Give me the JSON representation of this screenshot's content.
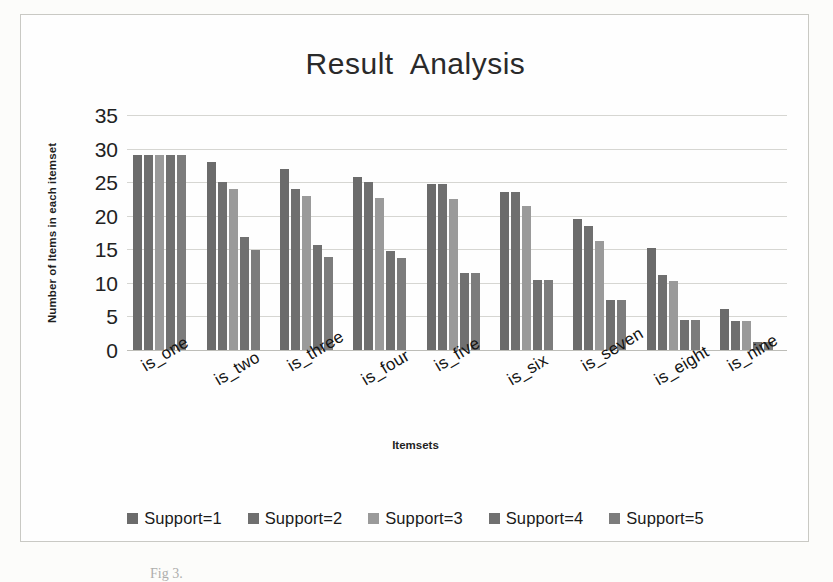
{
  "figure": {
    "caption": "Fig 3."
  },
  "chart_data": {
    "type": "bar",
    "title": "Result  Analysis",
    "xlabel": "Itemsets",
    "ylabel": "Number of Items in each itemset",
    "categories": [
      "is_one",
      "is_two",
      "is_three",
      "is_four",
      "is_five",
      "is_six",
      "is_seven",
      "is_eight",
      "is_nine"
    ],
    "yticks": [
      0,
      5,
      10,
      15,
      20,
      25,
      30,
      35
    ],
    "ylim": [
      0,
      35
    ],
    "grid": true,
    "legend_position": "bottom",
    "series": [
      {
        "name": "Support=1",
        "color": "#6b6b6b",
        "values": [
          29,
          28,
          27,
          25.8,
          24.7,
          23.5,
          19.5,
          15.2,
          6.1
        ]
      },
      {
        "name": "Support=2",
        "color": "#6f6f6f",
        "values": [
          29,
          25,
          24,
          25,
          24.7,
          23.5,
          18.4,
          11.2,
          4.3
        ]
      },
      {
        "name": "Support=3",
        "color": "#9a9a9a",
        "values": [
          29,
          24,
          23,
          22.7,
          22.5,
          21.4,
          16.2,
          10.3,
          4.3
        ]
      },
      {
        "name": "Support=4",
        "color": "#707070",
        "values": [
          29,
          16.8,
          15.7,
          14.7,
          11.5,
          10.5,
          7.4,
          4.4,
          1.2
        ]
      },
      {
        "name": "Support=5",
        "color": "#7c7c7c",
        "values": [
          29,
          14.9,
          13.8,
          13.7,
          11.5,
          10.5,
          7.4,
          4.4,
          1.2
        ]
      }
    ]
  }
}
